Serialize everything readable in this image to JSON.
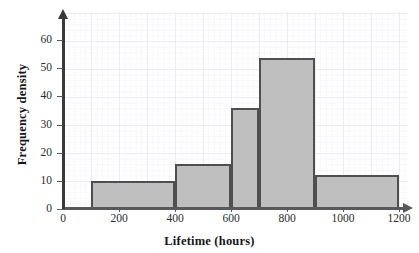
{
  "chart_data": {
    "type": "bar",
    "title": "",
    "xlabel": "Lifetime (hours)",
    "ylabel": "Frequency density",
    "xlim": [
      0,
      1200
    ],
    "ylim": [
      0,
      68
    ],
    "grid": true,
    "legend": null,
    "bin_edges": [
      100,
      400,
      600,
      700,
      900,
      1200
    ],
    "categories": [
      "100-400",
      "400-600",
      "600-700",
      "700-900",
      "900-1200"
    ],
    "values": [
      10,
      16,
      36,
      53.5,
      12
    ],
    "bars": [
      {
        "label": "100-400",
        "x_start": 100,
        "x_end": 400,
        "frequency_density": 10
      },
      {
        "label": "400-600",
        "x_start": 400,
        "x_end": 600,
        "frequency_density": 16
      },
      {
        "label": "600-700",
        "x_start": 600,
        "x_end": 700,
        "frequency_density": 36
      },
      {
        "label": "700-900",
        "x_start": 700,
        "x_end": 900,
        "frequency_density": 53.5
      },
      {
        "label": "900-1200",
        "x_start": 900,
        "x_end": 1200,
        "frequency_density": 12
      }
    ],
    "y_ticks": [
      0,
      10,
      20,
      30,
      40,
      50,
      60
    ],
    "y_tick_labels": [
      "0",
      "10",
      "20",
      "30",
      "40",
      "50",
      "60"
    ],
    "x_ticks": [
      0,
      200,
      400,
      600,
      800,
      1000,
      1200
    ],
    "x_tick_labels": [
      "0",
      "200",
      "400",
      "600",
      "800",
      "1000",
      "1200"
    ],
    "colors": {
      "bar_fill": "#bfbfbf",
      "bar_edge": "#4f4f52",
      "axis": "#59595c",
      "grid": "#ececf2",
      "background": "#ffffff",
      "text": "#16161a"
    }
  }
}
